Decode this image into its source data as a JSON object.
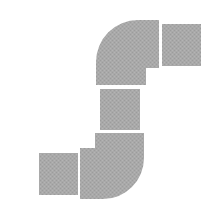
{
  "diagram": {
    "fill_color": "#a9a9a9",
    "texture_color": "#9c9c9c",
    "background": "#ffffff",
    "pieces": [
      {
        "id": "top-right-square",
        "type": "square-segment"
      },
      {
        "id": "top-elbow",
        "type": "elbow"
      },
      {
        "id": "middle-square",
        "type": "square-segment"
      },
      {
        "id": "bottom-elbow",
        "type": "elbow"
      },
      {
        "id": "bottom-left-square",
        "type": "square-segment"
      }
    ]
  }
}
